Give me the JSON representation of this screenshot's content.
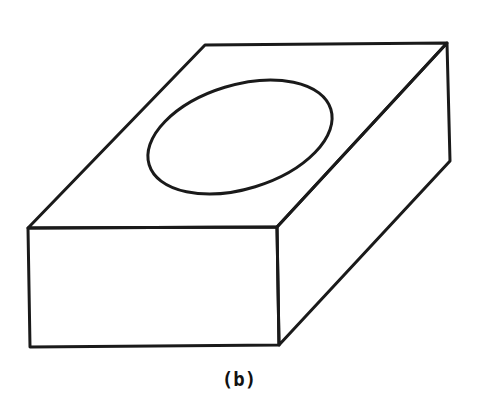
{
  "figure": {
    "label": "(b)",
    "stroke_color": "#1a1a1a",
    "background": "#ffffff",
    "shapes": {
      "top_face": [
        [
          205,
          45
        ],
        [
          447,
          43
        ],
        [
          277,
          227
        ],
        [
          28,
          228
        ]
      ],
      "front_face": [
        [
          28,
          228
        ],
        [
          277,
          227
        ],
        [
          279,
          345
        ],
        [
          30,
          347
        ]
      ],
      "right_face": [
        [
          277,
          227
        ],
        [
          447,
          43
        ],
        [
          450,
          161
        ],
        [
          279,
          345
        ]
      ],
      "ellipse": {
        "cx": 240,
        "cy": 137,
        "rx": 95,
        "ry": 52,
        "rotate": -17
      }
    }
  }
}
